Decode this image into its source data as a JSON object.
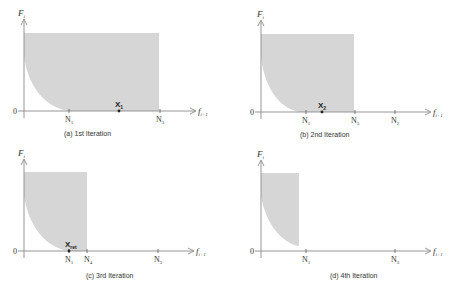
{
  "panels": [
    {
      "id": "a",
      "caption": "(a) 1st Iteration",
      "y_axis_label": "F",
      "y_axis_sub": "i",
      "x_axis_label": "f",
      "x_axis_sub": "i+1",
      "origin_label": "0",
      "ticks": [
        {
          "label": "N",
          "sub": "1"
        },
        {
          "label": "N",
          "sub": "3"
        }
      ],
      "point": {
        "label": "X",
        "sub": "1"
      }
    },
    {
      "id": "b",
      "caption": "(b) 2nd Iteration",
      "y_axis_label": "F",
      "y_axis_sub": "i",
      "x_axis_label": "f",
      "x_axis_sub": "i+1",
      "origin_label": "0",
      "ticks": [
        {
          "label": "N",
          "sub": "1"
        },
        {
          "label": "N",
          "sub": "3"
        },
        {
          "label": "N",
          "sub": "2"
        }
      ],
      "point": {
        "label": "X",
        "sub": "2"
      }
    },
    {
      "id": "c",
      "caption": "(c) 3rd Iteration",
      "y_axis_label": "F",
      "y_axis_sub": "i",
      "x_axis_label": "f",
      "x_axis_sub": "i+1",
      "origin_label": "0",
      "ticks": [
        {
          "label": "N",
          "sub": "1"
        },
        {
          "label": "N",
          "sub": "4"
        },
        {
          "label": "N",
          "sub": "3"
        }
      ],
      "point": {
        "label": "X",
        "sub": "ret"
      }
    },
    {
      "id": "d",
      "caption": "(d) 4th Iteration",
      "y_axis_label": "F",
      "y_axis_sub": "i",
      "x_axis_label": "f",
      "x_axis_sub": "i+1",
      "origin_label": "0",
      "ticks": [
        {
          "label": "N",
          "sub": "1"
        },
        {
          "label": "N",
          "sub": "3"
        }
      ]
    }
  ],
  "colors": {
    "shade": "#d6d6d6",
    "axis": "#8a8a8a"
  }
}
